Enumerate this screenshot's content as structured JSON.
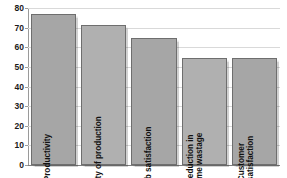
{
  "chart_data": {
    "type": "bar",
    "title": "",
    "subtitle": "",
    "xlabel": "",
    "ylabel": "",
    "categories": [
      "Productivity",
      "Quality of production",
      "Job satisfaction",
      "Reduction in\ntime wastage",
      "Customer\nsatisfaction"
    ],
    "values": [
      77,
      71.5,
      64.5,
      54.5,
      54.5
    ],
    "ylim": [
      0,
      80
    ],
    "yticks": [
      0,
      10,
      20,
      30,
      40,
      50,
      60,
      70,
      80
    ],
    "ytick_labels": [
      "0",
      "10",
      "20",
      "30",
      "40",
      "50",
      "60",
      "70",
      "80"
    ],
    "grid": true,
    "grid_axis": "y",
    "legend": false,
    "legend_position": "none",
    "bar_color": "#a6a6a6",
    "bar_color_alt": "#b0b0b0",
    "bar_edge_color": "#6e6e6e",
    "gridline_color": "#d9d9d9",
    "axis_color": "#9a9a9a",
    "background_color": "#ffffff",
    "label_color": "#121212",
    "label_orientation": "vertical",
    "label_placement": "inside-bar"
  }
}
